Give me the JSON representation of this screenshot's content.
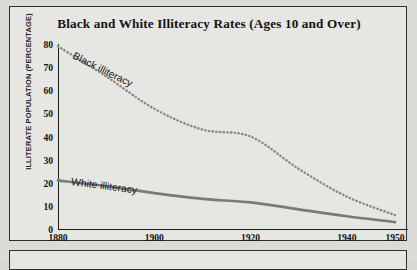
{
  "chart_data": {
    "type": "line",
    "title": "Black and White Illiteracy Rates (Ages 10 and Over)",
    "xlabel": "",
    "ylabel": "ILLITERATE POPULATION (PERCENTAGE)",
    "xlim": [
      1880,
      1950
    ],
    "ylim": [
      0,
      80
    ],
    "grid": false,
    "legend_position": "inline-labels",
    "x_ticks": [
      1880,
      1900,
      1920,
      1940,
      1950
    ],
    "x_tick_labels": [
      "1880",
      "1900",
      "1920",
      "1940",
      "1950"
    ],
    "y_ticks": [
      0,
      10,
      20,
      30,
      40,
      50,
      60,
      70,
      80
    ],
    "y_tick_labels": [
      "0",
      "10",
      "20",
      "30",
      "40",
      "50",
      "60",
      "70",
      "80"
    ],
    "x": [
      1880,
      1890,
      1900,
      1910,
      1920,
      1930,
      1940,
      1950
    ],
    "series": [
      {
        "name": "Black illiteracy",
        "style": "dotted",
        "color": "#8a8a8a",
        "values": [
          79.0,
          66.0,
          52.0,
          43.0,
          40.0,
          26.0,
          14.0,
          6.0
        ]
      },
      {
        "name": "White illiteracy",
        "style": "solid",
        "color": "#7a7a7a",
        "values": [
          21.0,
          18.5,
          15.5,
          13.0,
          11.5,
          8.5,
          5.5,
          3.0
        ]
      }
    ],
    "annotations": [
      {
        "text": "Black illiteracy",
        "series": "Black illiteracy"
      },
      {
        "text": "White illiteracy",
        "series": "White illiteracy"
      }
    ]
  },
  "figure": {
    "background_color": "#e6e6e2",
    "frame_color": "#2e2e2e",
    "axis_color": "#1d1d1d",
    "text_color": "#141414"
  }
}
